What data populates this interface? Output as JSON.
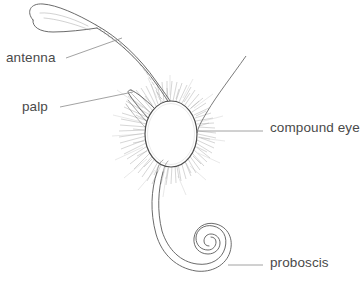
{
  "figure": {
    "background_color": "#ffffff",
    "line_color": "#555555",
    "hair_color": "#9a9a9a",
    "text_color": "#4a4a4a",
    "width": 362,
    "height": 297
  },
  "labels": [
    {
      "id": "antenna",
      "text": "antenna",
      "x": 6,
      "y": 51,
      "anchor": "left",
      "leader_from": [
        66,
        58
      ],
      "leader_to": [
        122,
        38
      ]
    },
    {
      "id": "palp",
      "text": "palp",
      "x": 22,
      "y": 100,
      "anchor": "left",
      "leader_from": [
        60,
        107
      ],
      "leader_to": [
        133,
        92
      ]
    },
    {
      "id": "compound_eye",
      "text": "compound eye",
      "x": 270,
      "y": 121,
      "anchor": "right",
      "leader_from": [
        263,
        131
      ],
      "leader_to": [
        196,
        131
      ]
    },
    {
      "id": "proboscis",
      "text": "proboscis",
      "x": 270,
      "y": 256,
      "anchor": "right",
      "leader_from": [
        263,
        265
      ],
      "leader_to": [
        228,
        265
      ]
    }
  ],
  "parts": [
    {
      "id": "antenna",
      "name": "antenna",
      "description": "long curved clubbed antenna sweeping from upper-left tip down to the head"
    },
    {
      "id": "palp",
      "name": "palp",
      "description": "tapered labial palp pointing up and to the left"
    },
    {
      "id": "compound_eye",
      "name": "compound eye",
      "description": "large oval eye outline surrounded by radiating hairs"
    },
    {
      "id": "proboscis",
      "name": "proboscis",
      "description": "double-line tube curving down from the head into a tight spiral coil"
    }
  ]
}
